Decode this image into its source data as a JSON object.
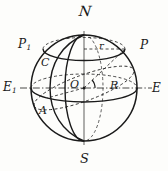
{
  "figure": {
    "background_color": "#fdfdfb",
    "ink_color": "#1a1a1a"
  },
  "labels": {
    "north_pole": "Ν",
    "north_pole_plain": "N",
    "south_pole": "S",
    "pole_right": "P",
    "pole_left_base": "P",
    "pole_left_sub": "1",
    "equator_right": "E",
    "equator_left_base": "E",
    "equator_left_sub": "1",
    "point_c": "C",
    "point_a": "A",
    "center": "O",
    "radius_sphere": "R",
    "radius_circle": "r"
  },
  "geometry": {
    "sphere": {
      "cx": 84,
      "cy": 88,
      "r": 53
    },
    "axis": {
      "top_x": 84,
      "top_y": 35,
      "bottom_x": 84,
      "bottom_y": 141
    },
    "equator": {
      "cx": 84,
      "cy": 88,
      "rx": 53,
      "ry": 14
    },
    "latitude_circle": {
      "cx": 84,
      "cy": 48,
      "rx": 41,
      "ry": 11
    },
    "meridian": {
      "cx": 84,
      "cy": 88,
      "rx": 18,
      "ry": 53
    },
    "tilted_circle": {
      "cx": 84,
      "cy": 88,
      "rx": 53,
      "ry": 13,
      "rotate_deg": -17
    },
    "radius_r_line": {
      "x1": 84,
      "y1": 48,
      "x2": 125,
      "y2": 48
    },
    "radius_R_line": {
      "x1": 84,
      "y1": 88,
      "x2": 137,
      "y2": 88
    },
    "slant_line": {
      "x1": 84,
      "y1": 88,
      "x2": 125,
      "y2": 48
    },
    "angle_arc_radius": 11
  },
  "line_styles": {
    "solid": "continuous outline and front arcs",
    "dashed": "hidden back arcs and construction lines",
    "dashdot": "equatorial diameter axis E1-E"
  },
  "annotations": [
    {
      "name": "sphere-outline",
      "style": "solid"
    },
    {
      "name": "equator-front",
      "style": "solid"
    },
    {
      "name": "equator-back",
      "style": "dashed"
    },
    {
      "name": "latitude-circle-front",
      "style": "solid"
    },
    {
      "name": "latitude-circle-back",
      "style": "dashed"
    },
    {
      "name": "meridian-front",
      "style": "solid"
    },
    {
      "name": "tilted-great-circle",
      "style": "mixed"
    },
    {
      "name": "radius-r",
      "style": "dashed"
    },
    {
      "name": "radius-R",
      "style": "dashdot"
    },
    {
      "name": "slant-radius-OP",
      "style": "dashed"
    },
    {
      "name": "angle-arc",
      "style": "solid"
    }
  ]
}
